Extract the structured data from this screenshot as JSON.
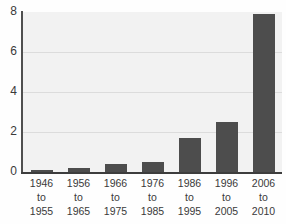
{
  "chart_data": {
    "type": "bar",
    "title": "",
    "subtitle": "",
    "xlabel": "",
    "ylabel": "",
    "categories": [
      "1946 to 1955",
      "1956 to 1965",
      "1966 to 1975",
      "1976 to 1985",
      "1986 to 1995",
      "1996 to 2005",
      "2006 to 2010"
    ],
    "category_lines": [
      [
        "1946",
        "to",
        "1955"
      ],
      [
        "1956",
        "to",
        "1965"
      ],
      [
        "1966",
        "to",
        "1975"
      ],
      [
        "1976",
        "to",
        "1985"
      ],
      [
        "1986",
        "to",
        "1995"
      ],
      [
        "1996",
        "to",
        "2005"
      ],
      [
        "2006",
        "to",
        "2010"
      ]
    ],
    "values": [
      0.1,
      0.2,
      0.4,
      0.5,
      1.7,
      2.5,
      7.9
    ],
    "ylim": [
      0,
      8
    ],
    "yticks": [
      0,
      2,
      4,
      6,
      8
    ],
    "ytick_labels": [
      "0",
      "2",
      "4",
      "6",
      "8"
    ],
    "grid": true,
    "grid_axis": "y",
    "legend": false,
    "legend_position": "none",
    "bar_color": "#4d4d4d",
    "plot_background": "#f2f2f2",
    "gridline_color": "#dcdcdc",
    "axis_color": "#3d3d3d",
    "text_color": "#3a3a3a"
  }
}
